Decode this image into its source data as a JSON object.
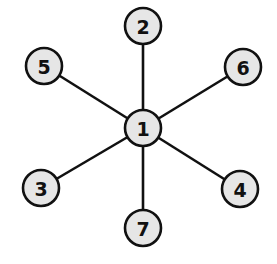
{
  "graph": {
    "type": "star",
    "center_node": "1",
    "nodes": [
      {
        "id": "1",
        "label": "1",
        "x": 143,
        "y": 128
      },
      {
        "id": "2",
        "label": "2",
        "x": 143,
        "y": 26
      },
      {
        "id": "3",
        "label": "3",
        "x": 41,
        "y": 188
      },
      {
        "id": "4",
        "label": "4",
        "x": 240,
        "y": 189
      },
      {
        "id": "5",
        "label": "5",
        "x": 44,
        "y": 66
      },
      {
        "id": "6",
        "label": "6",
        "x": 243,
        "y": 67
      },
      {
        "id": "7",
        "label": "7",
        "x": 143,
        "y": 228
      }
    ],
    "edges": [
      {
        "from": "1",
        "to": "2"
      },
      {
        "from": "1",
        "to": "3"
      },
      {
        "from": "1",
        "to": "4"
      },
      {
        "from": "1",
        "to": "5"
      },
      {
        "from": "1",
        "to": "6"
      },
      {
        "from": "1",
        "to": "7"
      }
    ],
    "node_radius": 18,
    "colors": {
      "node_fill": "#e6e6e6",
      "stroke": "#111111",
      "background": "#ffffff"
    }
  }
}
